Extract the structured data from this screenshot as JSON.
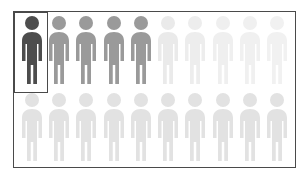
{
  "chart_data": {
    "type": "pictogram",
    "title": "",
    "subtitle": "",
    "xlabel": "",
    "ylabel": "",
    "total_units": 20,
    "unit_icon": "person-icon",
    "rows": 2,
    "columns": 10,
    "highlighted_units": 1,
    "emphasis_note": "1 of 20 figures is highlighted in dark gray with a rectangular outline",
    "legend": [],
    "annotations": [],
    "grid": false,
    "series": [
      {
        "name": "Top row",
        "values": [
          1,
          1,
          1,
          1,
          1,
          1,
          1,
          1,
          1,
          1
        ],
        "shades": [
          "#4d4d4d",
          "#9a9a9a",
          "#9a9a9a",
          "#9a9a9a",
          "#9a9a9a",
          "#eaeaea",
          "#ededed",
          "#efefef",
          "#f0f0f0",
          "#f1f1f1"
        ]
      },
      {
        "name": "Bottom row",
        "values": [
          1,
          1,
          1,
          1,
          1,
          1,
          1,
          1,
          1,
          1
        ],
        "shades": [
          "#e2e2e2",
          "#e2e2e2",
          "#e2e2e2",
          "#e2e2e2",
          "#e2e2e2",
          "#e2e2e2",
          "#e2e2e2",
          "#e2e2e2",
          "#e2e2e2",
          "#e2e2e2"
        ]
      }
    ]
  },
  "colors": {
    "background": "#ffffff",
    "frame_border": "#4a4a4a",
    "highlight_border": "#4a4a4a",
    "highlighted_figure": "#4d4d4d",
    "active_figure": "#9a9a9a",
    "faded_figure": "#eeeeee",
    "secondary_row_figure": "#e2e2e2"
  },
  "figures": {
    "top": [
      {
        "name": "figure-1",
        "state": "highlighted",
        "color": "#4d4d4d"
      },
      {
        "name": "figure-2",
        "state": "active",
        "color": "#9a9a9a"
      },
      {
        "name": "figure-3",
        "state": "active",
        "color": "#9a9a9a"
      },
      {
        "name": "figure-4",
        "state": "active",
        "color": "#9a9a9a"
      },
      {
        "name": "figure-5",
        "state": "active",
        "color": "#9a9a9a"
      },
      {
        "name": "figure-6",
        "state": "faded",
        "color": "#eaeaea"
      },
      {
        "name": "figure-7",
        "state": "faded",
        "color": "#ededed"
      },
      {
        "name": "figure-8",
        "state": "faded",
        "color": "#efefef"
      },
      {
        "name": "figure-9",
        "state": "faded",
        "color": "#f0f0f0"
      },
      {
        "name": "figure-10",
        "state": "faded",
        "color": "#f1f1f1"
      }
    ],
    "bottom": [
      {
        "name": "figure-11",
        "state": "muted",
        "color": "#e2e2e2"
      },
      {
        "name": "figure-12",
        "state": "muted",
        "color": "#e2e2e2"
      },
      {
        "name": "figure-13",
        "state": "muted",
        "color": "#e2e2e2"
      },
      {
        "name": "figure-14",
        "state": "muted",
        "color": "#e2e2e2"
      },
      {
        "name": "figure-15",
        "state": "muted",
        "color": "#e2e2e2"
      },
      {
        "name": "figure-16",
        "state": "muted",
        "color": "#e2e2e2"
      },
      {
        "name": "figure-17",
        "state": "muted",
        "color": "#e2e2e2"
      },
      {
        "name": "figure-18",
        "state": "muted",
        "color": "#e2e2e2"
      },
      {
        "name": "figure-19",
        "state": "muted",
        "color": "#e2e2e2"
      },
      {
        "name": "figure-20",
        "state": "muted",
        "color": "#e2e2e2"
      }
    ]
  }
}
